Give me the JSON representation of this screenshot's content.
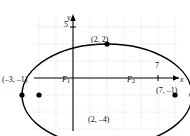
{
  "figure": {
    "type": "coordinate-plane-ellipse",
    "axis_labels": {
      "x": "x",
      "y": "y"
    },
    "tick_labels": {
      "y_five": "5",
      "x_seven": "7"
    },
    "point_labels": {
      "top_vertex": "(2, 2)",
      "bottom_vertex": "(2, –4)",
      "left_vertex": "(–3, –1)",
      "right_vertex": "(7, –1)",
      "focus_left": "F",
      "focus_left_sub": "1",
      "focus_right": "F",
      "focus_right_sub": "2"
    },
    "colors": {
      "curve": "#000000",
      "axis": "#000000",
      "grid": "#cfcfcf",
      "point": "#000000",
      "background": "#ffffff"
    }
  },
  "chart_data": {
    "type": "scatter",
    "title": "",
    "xlabel": "x",
    "ylabel": "y",
    "grid": true,
    "legend": "none",
    "xlim": [
      -4.3,
      8.6
    ],
    "ylim": [
      -5.2,
      5.7
    ],
    "grid_step": 1,
    "curve": {
      "shape": "ellipse",
      "center": [
        2,
        -1
      ],
      "semi_major_x": 5,
      "semi_minor_y": 3,
      "equation": "(x-2)^2/25 + (y+1)^2/9 = 1"
    },
    "points": [
      {
        "label": "(2, 2)",
        "x": 2,
        "y": 2,
        "role": "co-vertex-top"
      },
      {
        "label": "(2, –4)",
        "x": 2,
        "y": -4,
        "role": "co-vertex-bottom"
      },
      {
        "label": "(–3, –1)",
        "x": -3,
        "y": -1,
        "role": "vertex-left"
      },
      {
        "label": "(7, –1)",
        "x": 7,
        "y": -1,
        "role": "vertex-right"
      },
      {
        "label": "F1",
        "x": -2,
        "y": -1,
        "role": "focus-left"
      },
      {
        "label": "F2",
        "x": 6,
        "y": -1,
        "role": "focus-right"
      }
    ],
    "ticks": [
      {
        "axis": "y",
        "value": 5,
        "label": "5"
      },
      {
        "axis": "x",
        "value": 7,
        "label": "7"
      }
    ]
  }
}
